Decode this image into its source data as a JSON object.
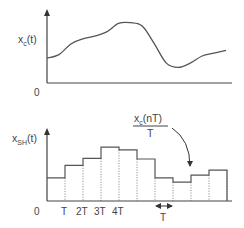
{
  "top_plot": {
    "ylabel_main": "x",
    "ylabel_sub": "c",
    "ylabel_arg": "(t)",
    "origin_label": "0",
    "curve": [
      0.35,
      0.4,
      0.55,
      0.62,
      0.66,
      0.72,
      0.84,
      0.85,
      0.8,
      0.55,
      0.28,
      0.22,
      0.28,
      0.38,
      0.42,
      0.46
    ]
  },
  "bottom_plot": {
    "ylabel_main": "x",
    "ylabel_sub": "SH",
    "ylabel_arg": "(t)",
    "origin_label": "0",
    "tick_labels": [
      "T",
      "2T",
      "3T",
      "4T"
    ],
    "sample_values": [
      0.33,
      0.51,
      0.61,
      0.77,
      0.73,
      0.6,
      0.33,
      0.27,
      0.37,
      0.44
    ],
    "annotation": {
      "numerator_main": "x",
      "numerator_sub": "c",
      "numerator_arg": "(nT)",
      "denominator": "T"
    },
    "span_label": "T"
  }
}
